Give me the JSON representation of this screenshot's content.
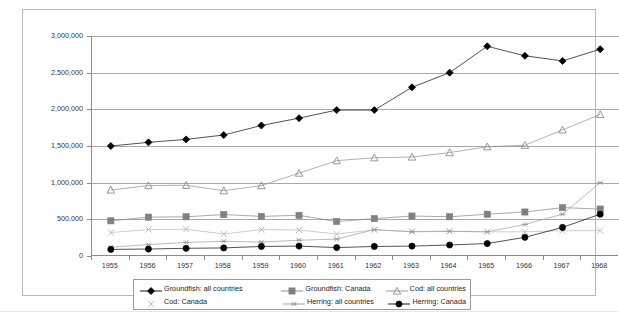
{
  "chart_data": {
    "type": "line",
    "title": "",
    "subtitle": "",
    "xlabel": "",
    "ylabel": "",
    "grid": true,
    "legend_position": "bottom",
    "xlim": [
      1955,
      1968
    ],
    "ylim": [
      0,
      3000000
    ],
    "ytick_labels": [
      "3,000,000",
      "2,500,000",
      "2,000,000",
      "1,500,000",
      "1,000,000",
      "500,000",
      "0"
    ],
    "ytick_values": [
      3000000,
      2500000,
      2000000,
      1500000,
      1000000,
      500000,
      0
    ],
    "categories": [
      "1955",
      "1956",
      "1957",
      "1958",
      "1959",
      "1960",
      "1961",
      "1962",
      "1963",
      "1964",
      "1965",
      "1966",
      "1967",
      "1968"
    ],
    "x": [
      1955,
      1956,
      1957,
      1958,
      1959,
      1960,
      1961,
      1962,
      1963,
      1964,
      1965,
      1966,
      1967,
      1968
    ],
    "series": [
      {
        "name": "Groundfish: all countries",
        "marker": "diamond",
        "color": "#000000",
        "values": [
          1500000,
          1550000,
          1590000,
          1650000,
          1780000,
          1880000,
          1990000,
          1990000,
          2300000,
          2500000,
          2860000,
          2730000,
          2660000,
          2820000
        ]
      },
      {
        "name": "Groundfish: Canada",
        "marker": "square",
        "color": "#808080",
        "values": [
          480000,
          530000,
          535000,
          565000,
          540000,
          555000,
          470000,
          510000,
          545000,
          535000,
          570000,
          600000,
          660000,
          640000
        ]
      },
      {
        "name": "Cod: all countries",
        "marker": "triangle",
        "color": "#8c8c8c",
        "values": [
          900000,
          960000,
          965000,
          890000,
          960000,
          1130000,
          1300000,
          1340000,
          1350000,
          1410000,
          1490000,
          1510000,
          1720000,
          1930000
        ]
      },
      {
        "name": "Cod: Canada",
        "marker": "cross",
        "color": "#b5b5b5",
        "values": [
          320000,
          360000,
          365000,
          300000,
          360000,
          355000,
          300000,
          355000,
          335000,
          340000,
          330000,
          330000,
          345000,
          345000
        ]
      },
      {
        "name": "Herring: all countries",
        "marker": "asterisk",
        "color": "#9a9a9a",
        "values": [
          120000,
          155000,
          185000,
          200000,
          190000,
          215000,
          230000,
          360000,
          330000,
          335000,
          330000,
          430000,
          570000,
          1000000
        ]
      },
      {
        "name": "Herring: Canada",
        "marker": "circle",
        "color": "#000000",
        "values": [
          90000,
          95000,
          105000,
          110000,
          130000,
          135000,
          115000,
          130000,
          135000,
          150000,
          170000,
          255000,
          390000,
          570000
        ]
      }
    ]
  },
  "legend": {
    "items": [
      {
        "label": "Groundfish: all countries",
        "marker": "diamond-marker"
      },
      {
        "label": "Groundfish: Canada",
        "marker": "square-marker"
      },
      {
        "label": "Cod: all countries",
        "marker": "triangle-marker"
      },
      {
        "label": "Cod: Canada",
        "marker": "cross-marker"
      },
      {
        "label": "Herring: all countries",
        "marker": "asterisk-marker"
      },
      {
        "label": "Herring: Canada",
        "marker": "circle-marker"
      }
    ]
  }
}
